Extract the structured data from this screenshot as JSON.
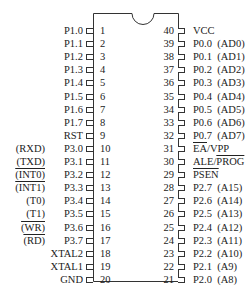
{
  "diagram": {
    "title": "",
    "type": "DIP-40 microcontroller pinout",
    "left_pins": [
      {
        "num": "1",
        "name": "P1.0",
        "alt": ""
      },
      {
        "num": "2",
        "name": "P1.1",
        "alt": ""
      },
      {
        "num": "3",
        "name": "P1.2",
        "alt": ""
      },
      {
        "num": "4",
        "name": "P1.3",
        "alt": ""
      },
      {
        "num": "5",
        "name": "P1.4",
        "alt": ""
      },
      {
        "num": "6",
        "name": "P1.5",
        "alt": ""
      },
      {
        "num": "7",
        "name": "P1.6",
        "alt": ""
      },
      {
        "num": "8",
        "name": "P1.7",
        "alt": ""
      },
      {
        "num": "9",
        "name": "RST",
        "alt": ""
      },
      {
        "num": "10",
        "name": "P3.0",
        "alt": "(RXD)"
      },
      {
        "num": "11",
        "name": "P3.1",
        "alt": "(TXD)"
      },
      {
        "num": "12",
        "name": "P3.2",
        "alt": "(INT0)",
        "alt_overline": true
      },
      {
        "num": "13",
        "name": "P3.3",
        "alt": "(INT1)",
        "alt_overline": true
      },
      {
        "num": "14",
        "name": "P3.4",
        "alt": "(T0)"
      },
      {
        "num": "15",
        "name": "P3.5",
        "alt": "(T1)"
      },
      {
        "num": "16",
        "name": "P3.6",
        "alt": "(WR)",
        "alt_overline": true
      },
      {
        "num": "17",
        "name": "P3.7",
        "alt": "(RD)",
        "alt_overline": true
      },
      {
        "num": "18",
        "name": "XTAL2",
        "alt": ""
      },
      {
        "num": "19",
        "name": "XTAL1",
        "alt": ""
      },
      {
        "num": "20",
        "name": "GND",
        "alt": ""
      }
    ],
    "right_pins": [
      {
        "num": "40",
        "name": "VCC"
      },
      {
        "num": "39",
        "name": "P0.0  (AD0)"
      },
      {
        "num": "38",
        "name": "P0.1  (AD1)"
      },
      {
        "num": "37",
        "name": "P0.2  (AD2)"
      },
      {
        "num": "36",
        "name": "P0.3  (AD3)"
      },
      {
        "num": "35",
        "name": "P0.4  (AD4)"
      },
      {
        "num": "34",
        "name": "P0.5  (AD5)"
      },
      {
        "num": "33",
        "name": "P0.6  (AD6)"
      },
      {
        "num": "32",
        "name": "P0.7  (AD7)"
      },
      {
        "num": "31",
        "name": "EA/VPP",
        "overline_part": "EA"
      },
      {
        "num": "30",
        "name": "ALE/PROG",
        "overline_part": "PROG"
      },
      {
        "num": "29",
        "name": "PSEN",
        "overline_part": "PSEN"
      },
      {
        "num": "28",
        "name": "P2.7  (A15)"
      },
      {
        "num": "27",
        "name": "P2.6  (A14)"
      },
      {
        "num": "26",
        "name": "P2.5  (A13)"
      },
      {
        "num": "25",
        "name": "P2.4  (A12)"
      },
      {
        "num": "24",
        "name": "P2.3  (A11)"
      },
      {
        "num": "23",
        "name": "P2.2  (A10)"
      },
      {
        "num": "22",
        "name": "P2.1  (A9)"
      },
      {
        "num": "21",
        "name": "P2.0  (A8)"
      }
    ],
    "special_labels": {
      "ea": "EA",
      "vpp": "/VPP",
      "ale": "ALE/",
      "prog": "PROG",
      "psen": "PSEN"
    }
  }
}
